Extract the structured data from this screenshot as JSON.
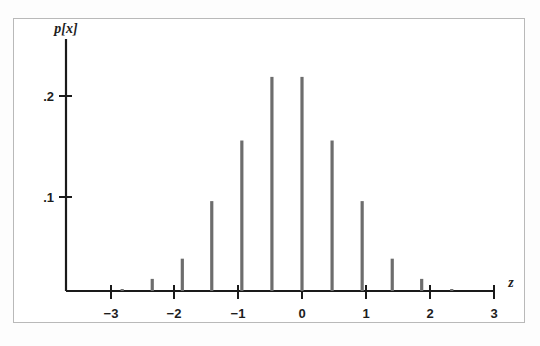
{
  "figure": {
    "caption": "",
    "background_color": "#ffffff",
    "frame_color": "#b9b9b9",
    "bar_color": "#6d6d6d",
    "axis_color": "#1a1a1a"
  },
  "axes": {
    "y_axis_title": "p[x]",
    "x_axis_title": "z",
    "x_tick_labels": [
      "−3",
      "−2",
      "−1",
      "0",
      "1",
      "2",
      "3"
    ],
    "y_tick_labels": [
      ".1",
      ".2"
    ]
  },
  "chart_data": {
    "type": "bar",
    "title": "",
    "subtitle": "",
    "xlabel": "z",
    "ylabel": "p[x]",
    "xlim": [
      -3.35,
      3.35
    ],
    "ylim": [
      0,
      0.235
    ],
    "xticks": [
      -3,
      -2,
      -1,
      0,
      1,
      2,
      3
    ],
    "xticklabels": [
      "−3",
      "−2",
      "−1",
      "0",
      "1",
      "2",
      "3"
    ],
    "yticks": [
      0.1,
      0.2
    ],
    "yticklabels": [
      ".1",
      ".2"
    ],
    "grid": false,
    "legend": null,
    "legend_position": "none",
    "annotations": [],
    "bar_style": "impulse",
    "x": [
      -2.81,
      -2.34,
      -1.87,
      -1.41,
      -0.94,
      -0.47,
      0.0,
      0.47,
      0.94,
      1.41,
      1.87,
      2.34,
      2.81
    ],
    "categories": [
      "-2.81",
      "-2.34",
      "-1.87",
      "-1.41",
      "-0.94",
      "-0.47",
      "0.00",
      "0.47",
      "0.94",
      "1.41",
      "1.87",
      "2.34",
      "2.81"
    ],
    "values": [
      0.002,
      0.012,
      0.032,
      0.089,
      0.149,
      0.212,
      0.212,
      0.149,
      0.089,
      0.032,
      0.012,
      0.002,
      0.0
    ],
    "series": [
      {
        "name": "p[x]",
        "values": [
          0.002,
          0.012,
          0.032,
          0.089,
          0.149,
          0.212,
          0.212,
          0.149,
          0.089,
          0.032,
          0.012,
          0.002,
          0.0
        ]
      }
    ],
    "note_points": [
      {
        "z": -2.81,
        "p": 0.002
      },
      {
        "z": -2.34,
        "p": 0.012
      },
      {
        "z": -1.87,
        "p": 0.032
      },
      {
        "z": -1.41,
        "p": 0.089
      },
      {
        "z": -0.94,
        "p": 0.149
      },
      {
        "z": -0.47,
        "p": 0.212
      },
      {
        "z": 0.0,
        "p": 0.212
      },
      {
        "z": 0.47,
        "p": 0.149
      },
      {
        "z": 0.94,
        "p": 0.089
      },
      {
        "z": 1.41,
        "p": 0.032
      },
      {
        "z": 1.87,
        "p": 0.012
      },
      {
        "z": 2.34,
        "p": 0.002
      }
    ]
  }
}
